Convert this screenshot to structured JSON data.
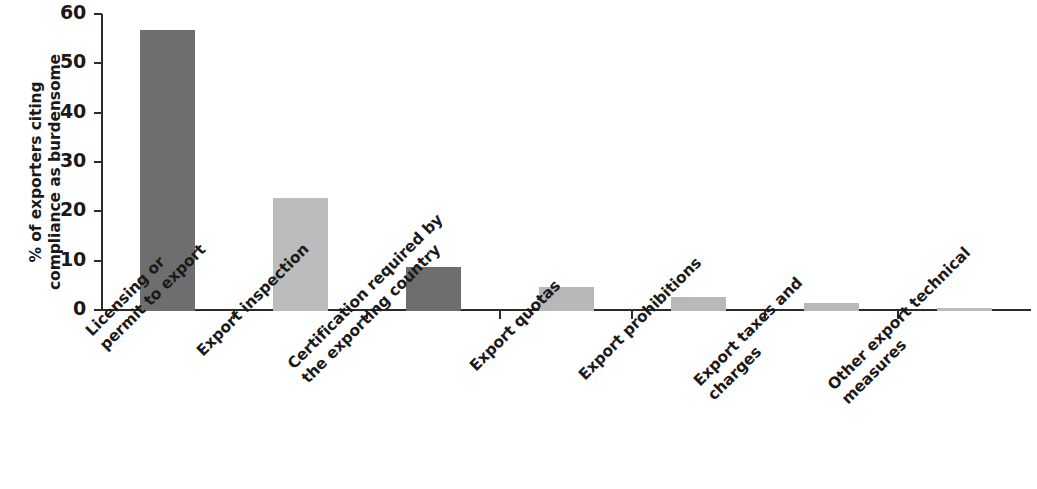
{
  "chart_data": {
    "type": "bar",
    "title": "",
    "subtitle": "",
    "xlabel": "",
    "ylabel": "% of exporters citing compliance as burdensome",
    "ylabel_lines": [
      "% of exporters citing",
      "compliance as burdensome"
    ],
    "ylim": [
      0,
      60
    ],
    "yticks": [
      0,
      10,
      20,
      30,
      40,
      50,
      60
    ],
    "ytick_labels": [
      "0",
      "10",
      "20",
      "30",
      "40",
      "50",
      "60"
    ],
    "grid": false,
    "legend": null,
    "legend_position": "none",
    "orientation": "vertical",
    "categories": [
      "Licensing or permit to export",
      "Export inspection",
      "Certification required by the exporting country",
      "Export quotas",
      "Export prohibitions",
      "Export taxes and charges",
      "Other export technical measures"
    ],
    "category_label_lines": [
      [
        "Licensing or",
        "permit to export"
      ],
      [
        "Export inspection",
        ""
      ],
      [
        "Certification required by",
        "the exporting country"
      ],
      [
        "Export quotas",
        ""
      ],
      [
        "Export prohibitions",
        ""
      ],
      [
        "Export taxes and",
        "charges"
      ],
      [
        "Other export technical",
        "measures"
      ]
    ],
    "values": [
      57,
      23,
      9,
      4.8,
      2.8,
      1.6,
      0.6
    ],
    "bar_colors": [
      "#6e6e6e",
      "#bcbcbc",
      "#6e6e6e",
      "#b8b8b8",
      "#b8b8b8",
      "#b8b8b8",
      "#bcbcbc"
    ],
    "axis_color": "#2b2b2b",
    "text_color": "#1a1a1a",
    "background": "#ffffff"
  }
}
